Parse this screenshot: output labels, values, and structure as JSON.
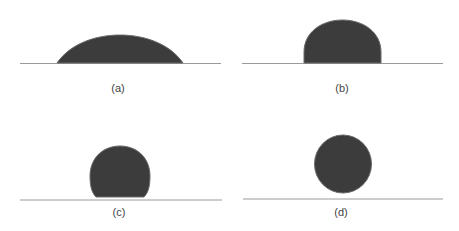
{
  "figure": {
    "panels": [
      {
        "id": "a",
        "label": "(a)",
        "shape": "flat-spread-droplet"
      },
      {
        "id": "b",
        "label": "(b)",
        "shape": "hemispherical-droplet"
      },
      {
        "id": "c",
        "label": "(c)",
        "shape": "near-spherical-droplet-on-surface"
      },
      {
        "id": "d",
        "label": "(d)",
        "shape": "spherical-droplet-above-surface"
      }
    ],
    "colors": {
      "droplet_fill": "#3c3c3c",
      "droplet_edge": "#6a6a6a",
      "surface_line": "#9a9a9a",
      "label_text": "#444444",
      "background": "#ffffff"
    }
  }
}
